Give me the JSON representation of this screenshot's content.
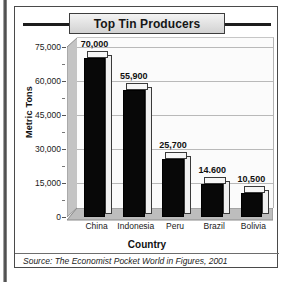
{
  "figure": {
    "title": "Top Tin Producers",
    "source": "Source: The Economist Pocket World in Figures, 2001"
  },
  "chart_data": {
    "type": "bar",
    "title": "Top Tin Producers",
    "xlabel": "Country",
    "ylabel": "Metric Tons",
    "categories": [
      "China",
      "Indonesia",
      "Peru",
      "Brazil",
      "Bolivia"
    ],
    "values": [
      70000,
      55900,
      25700,
      14600,
      10500
    ],
    "data_labels": [
      "70,000",
      "55,900",
      "25,700",
      "14.600",
      "10,500"
    ],
    "ylim": [
      0,
      75000
    ],
    "yticks": [
      0,
      15000,
      30000,
      45000,
      60000,
      75000
    ],
    "ytick_labels": [
      "0",
      "15,000",
      "30,000",
      "45,000",
      "60,000",
      "75,000"
    ],
    "grid": true,
    "legend": false,
    "style": "3d-column",
    "bar_color": "#080808",
    "plot_background": "#fbfbfb"
  }
}
